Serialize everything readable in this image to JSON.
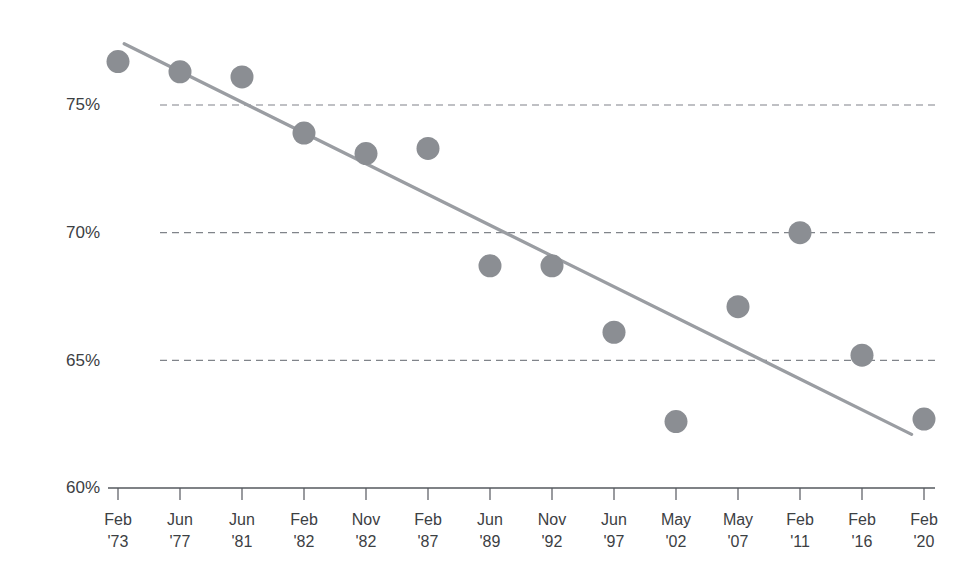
{
  "chart_data": {
    "type": "scatter",
    "title": "",
    "subtitle": "",
    "xlabel": "",
    "ylabel": "",
    "ylim": [
      60,
      78
    ],
    "yticks": [
      60,
      65,
      70,
      75
    ],
    "ytick_labels": [
      "60%",
      "70%",
      "65%",
      "75%"
    ],
    "grid": true,
    "legend": false,
    "categories": [
      "Feb '73",
      "Jun '77",
      "Jun '81",
      "Feb '82",
      "Nov '82",
      "Feb '87",
      "Jun '89",
      "Nov '92",
      "Jun '97",
      "May '02",
      "May '07",
      "Feb '11",
      "Feb '16",
      "Feb '20"
    ],
    "x_months": [
      "Feb",
      "Jun",
      "Jun",
      "Feb",
      "Nov",
      "Feb",
      "Jun",
      "Nov",
      "Jun",
      "May",
      "May",
      "Feb",
      "Feb",
      "Feb"
    ],
    "x_years": [
      "'73",
      "'77",
      "'81",
      "'82",
      "'82",
      "'87",
      "'89",
      "'92",
      "'97",
      "'02",
      "'07",
      "'11",
      "'16",
      "'20"
    ],
    "values": [
      76.7,
      76.3,
      76.1,
      73.9,
      73.1,
      73.3,
      68.7,
      68.7,
      66.1,
      62.6,
      67.1,
      70.0,
      65.2,
      62.7
    ],
    "series": [
      {
        "name": "Data points",
        "values": [
          76.7,
          76.3,
          76.1,
          73.9,
          73.1,
          73.3,
          68.7,
          68.7,
          66.1,
          62.6,
          67.1,
          70.0,
          65.2,
          62.7
        ]
      },
      {
        "name": "Trend line",
        "type": "line",
        "start": {
          "x_index": 0.1,
          "value": 77.4
        },
        "end": {
          "x_index": 12.8,
          "value": 62.1
        }
      }
    ],
    "annotations": []
  },
  "axis": {
    "y_labels": [
      {
        "text": "75%",
        "value": 75
      },
      {
        "text": "70%",
        "value": 70
      },
      {
        "text": "65%",
        "value": 65
      },
      {
        "text": "60%",
        "value": 60
      }
    ]
  },
  "colors": {
    "point": "#8b8e93",
    "trendline": "#9a9da2",
    "gridline": "#6b6f76",
    "axis": "#55585e",
    "text": "#3c4043",
    "background": "#ffffff"
  }
}
